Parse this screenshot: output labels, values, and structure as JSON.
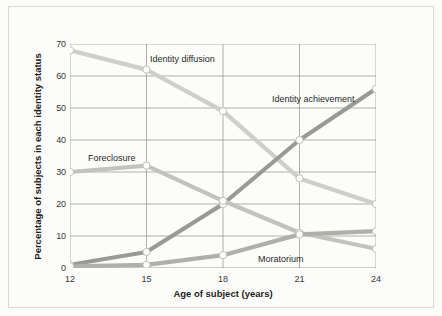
{
  "chart_data": {
    "type": "line",
    "title": "",
    "xlabel": "Age of subject (years)",
    "ylabel": "Percentage of subjects in each identity status",
    "x": [
      12,
      15,
      18,
      21,
      24
    ],
    "xticklabels": [
      "12",
      "15",
      "18",
      "21",
      "24"
    ],
    "yticklabels": [
      "0",
      "10",
      "20",
      "30",
      "40",
      "50",
      "60",
      "70"
    ],
    "yticks": [
      0,
      10,
      20,
      30,
      40,
      50,
      60,
      70
    ],
    "xlim": [
      12,
      24
    ],
    "ylim": [
      0,
      70
    ],
    "grid": true,
    "legend_position": "inline-annotations",
    "series": [
      {
        "name": "Identity diffusion",
        "values": [
          68,
          62,
          49,
          28,
          20
        ],
        "color": "#cfcfca",
        "label_x": 150,
        "label_y": 54
      },
      {
        "name": "Identity achievement",
        "values": [
          1,
          5,
          20,
          40,
          56
        ],
        "color": "#9a9a95",
        "label_x": 272,
        "label_y": 94
      },
      {
        "name": "Foreclosure",
        "values": [
          30,
          32,
          21,
          11,
          6
        ],
        "color": "#c3c3be",
        "label_x": 88,
        "label_y": 153
      },
      {
        "name": "Moratorium",
        "values": [
          0.5,
          1,
          4,
          10.5,
          11.5
        ],
        "color": "#b0b0ab",
        "label_x": 258,
        "label_y": 254
      }
    ]
  },
  "figure": {
    "background": "#fbfbfa",
    "frame_color": "#d8d8d4",
    "grid_color": "#8f8f8a",
    "marker_fill": "#ffffff",
    "marker_stroke": "#c0c0bb",
    "text_color": "#1d1d1b"
  }
}
